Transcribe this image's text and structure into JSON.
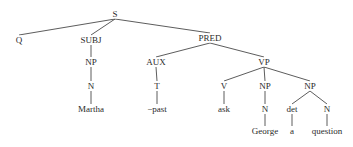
{
  "diagram": {
    "type": "syntax-tree",
    "nodes": [
      {
        "id": "S",
        "label": "S",
        "x": 115,
        "y": 14
      },
      {
        "id": "Q",
        "label": "Q",
        "x": 19,
        "y": 40
      },
      {
        "id": "SUBJ",
        "label": "SUBJ",
        "x": 91,
        "y": 40
      },
      {
        "id": "PRED",
        "label": "PRED",
        "x": 210,
        "y": 38
      },
      {
        "id": "NP1",
        "label": "NP",
        "x": 91,
        "y": 62
      },
      {
        "id": "AUX",
        "label": "AUX",
        "x": 156,
        "y": 62
      },
      {
        "id": "VP",
        "label": "VP",
        "x": 264,
        "y": 62
      },
      {
        "id": "N1",
        "label": "N",
        "x": 91,
        "y": 86
      },
      {
        "id": "T",
        "label": "T",
        "x": 157,
        "y": 86
      },
      {
        "id": "V",
        "label": "V",
        "x": 224,
        "y": 86
      },
      {
        "id": "NP2",
        "label": "NP",
        "x": 265,
        "y": 86
      },
      {
        "id": "NP3",
        "label": "NP",
        "x": 310,
        "y": 86
      },
      {
        "id": "Martha",
        "label": "Martha",
        "x": 91,
        "y": 109
      },
      {
        "id": "past",
        "label": "−past",
        "x": 157,
        "y": 109
      },
      {
        "id": "ask",
        "label": "ask",
        "x": 224,
        "y": 109
      },
      {
        "id": "N2",
        "label": "N",
        "x": 265,
        "y": 109
      },
      {
        "id": "det",
        "label": "det",
        "x": 292,
        "y": 109
      },
      {
        "id": "N3",
        "label": "N",
        "x": 327,
        "y": 109
      },
      {
        "id": "George",
        "label": "George",
        "x": 265,
        "y": 131
      },
      {
        "id": "a",
        "label": "a",
        "x": 292,
        "y": 131
      },
      {
        "id": "question",
        "label": "question",
        "x": 327,
        "y": 131
      }
    ],
    "edges": [
      [
        "S",
        "Q"
      ],
      [
        "S",
        "SUBJ"
      ],
      [
        "S",
        "PRED"
      ],
      [
        "SUBJ",
        "NP1"
      ],
      [
        "NP1",
        "N1"
      ],
      [
        "N1",
        "Martha"
      ],
      [
        "PRED",
        "AUX"
      ],
      [
        "PRED",
        "VP"
      ],
      [
        "AUX",
        "T"
      ],
      [
        "T",
        "past"
      ],
      [
        "VP",
        "V"
      ],
      [
        "VP",
        "NP2"
      ],
      [
        "VP",
        "NP3"
      ],
      [
        "V",
        "ask"
      ],
      [
        "NP2",
        "N2"
      ],
      [
        "N2",
        "George"
      ],
      [
        "NP3",
        "det"
      ],
      [
        "NP3",
        "N3"
      ],
      [
        "det",
        "a"
      ],
      [
        "N3",
        "question"
      ]
    ]
  }
}
